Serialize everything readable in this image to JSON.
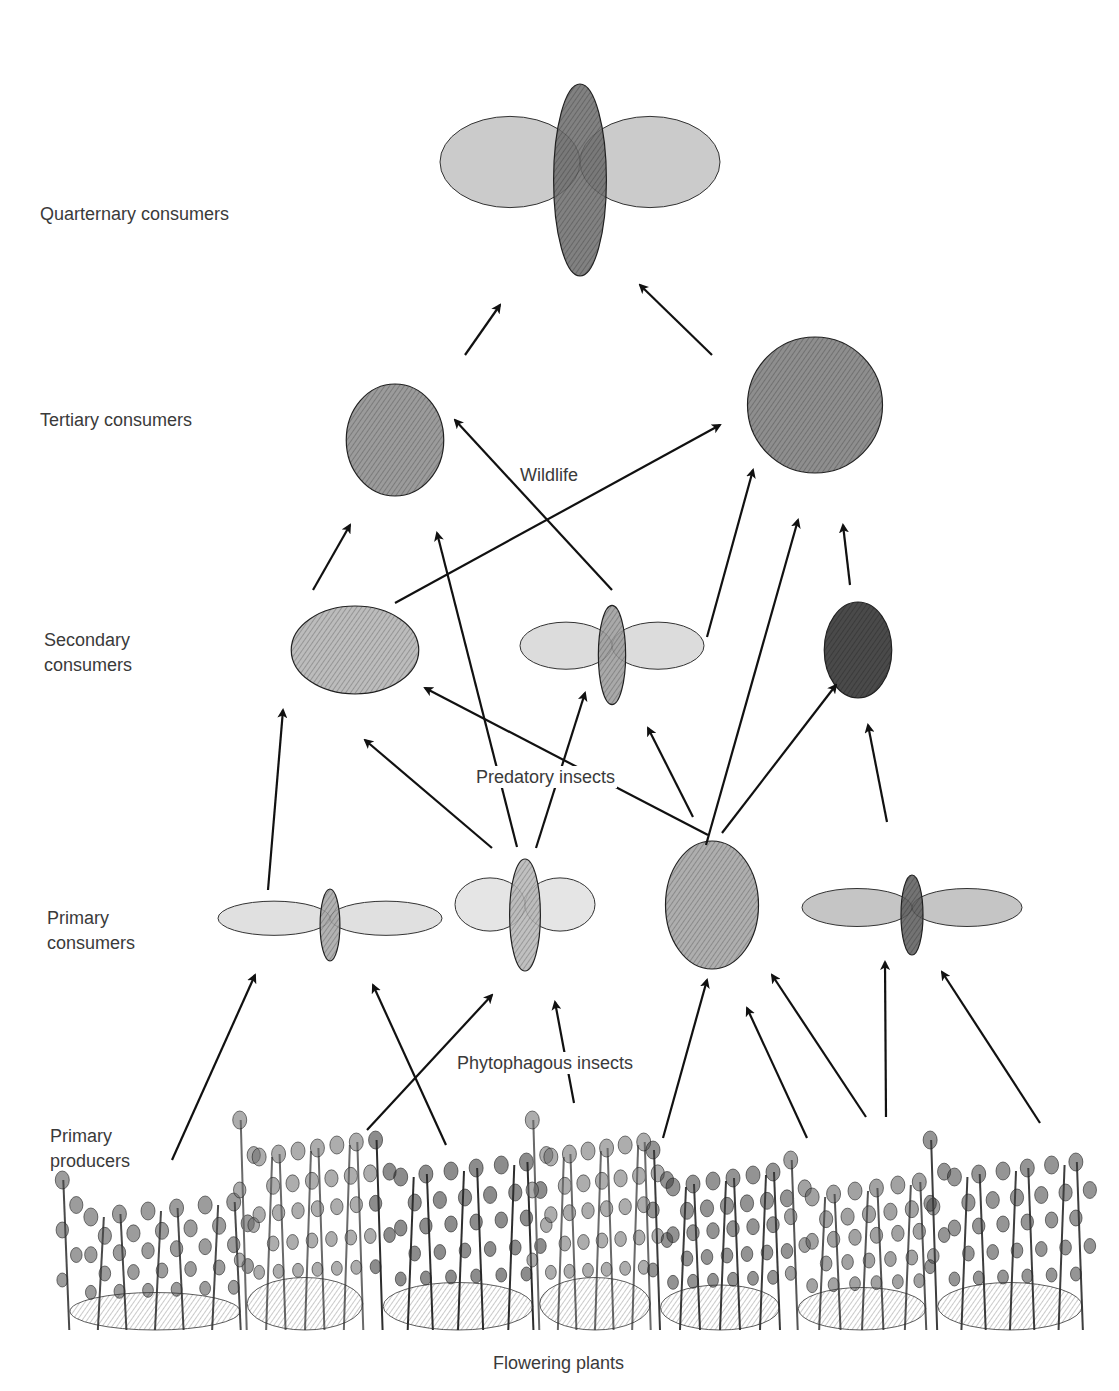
{
  "diagram": {
    "levels": [
      {
        "id": "quaternary",
        "label": "Quarternary consumers",
        "x": 40,
        "y": 202
      },
      {
        "id": "tertiary",
        "label": "Tertiary consumers",
        "x": 40,
        "y": 408
      },
      {
        "id": "secondary",
        "label": "Secondary\nconsumers",
        "x": 44,
        "y": 628
      },
      {
        "id": "primary_consumers",
        "label": "Primary\nconsumers",
        "x": 47,
        "y": 906
      },
      {
        "id": "primary_producers",
        "label": "Primary\nproducers",
        "x": 50,
        "y": 1124
      }
    ],
    "groups": [
      {
        "id": "wildlife",
        "label": "Wildlife",
        "x": 518,
        "y": 464
      },
      {
        "id": "predatory_insects",
        "label": "Predatory insects",
        "x": 474,
        "y": 766
      },
      {
        "id": "phytophagous_insects",
        "label": "Phytophagous insects",
        "x": 455,
        "y": 1052
      },
      {
        "id": "flowering_plants",
        "label": "Flowering plants",
        "x": 491,
        "y": 1352
      }
    ],
    "nodes": [
      {
        "id": "hawk",
        "name": "Hawk",
        "level": "quaternary",
        "cx": 580,
        "cy": 180,
        "rx": 140,
        "ry": 120,
        "shade": "#6b6b6b"
      },
      {
        "id": "frog",
        "name": "Frog",
        "level": "tertiary",
        "cx": 395,
        "cy": 440,
        "rx": 65,
        "ry": 70,
        "shade": "#8a8a8a"
      },
      {
        "id": "partridge",
        "name": "Partridge",
        "level": "tertiary",
        "cx": 815,
        "cy": 405,
        "rx": 90,
        "ry": 85,
        "shade": "#7a7a7a"
      },
      {
        "id": "mantis",
        "name": "Praying mantis",
        "level": "secondary",
        "cx": 355,
        "cy": 650,
        "rx": 85,
        "ry": 55,
        "shade": "#b0b0b0"
      },
      {
        "id": "dragonfly",
        "name": "Dragonfly",
        "level": "secondary",
        "cx": 612,
        "cy": 655,
        "rx": 92,
        "ry": 62,
        "shade": "#9a9a9a"
      },
      {
        "id": "beetle",
        "name": "Ground beetle",
        "level": "secondary",
        "cx": 858,
        "cy": 650,
        "rx": 45,
        "ry": 60,
        "shade": "#2a2a2a"
      },
      {
        "id": "cicada",
        "name": "Cicada",
        "level": "primary_consumers",
        "cx": 330,
        "cy": 925,
        "rx": 112,
        "ry": 45,
        "shade": "#a5a5a5"
      },
      {
        "id": "mosquito",
        "name": "Crane fly",
        "level": "primary_consumers",
        "cx": 525,
        "cy": 915,
        "rx": 70,
        "ry": 70,
        "shade": "#b5b5b5"
      },
      {
        "id": "bug",
        "name": "Plant bug",
        "level": "primary_consumers",
        "cx": 712,
        "cy": 905,
        "rx": 62,
        "ry": 80,
        "shade": "#a0a0a0"
      },
      {
        "id": "moth",
        "name": "Moth",
        "level": "primary_consumers",
        "cx": 912,
        "cy": 915,
        "rx": 110,
        "ry": 50,
        "shade": "#5a5a5a"
      },
      {
        "id": "plant1",
        "name": "Plant 1",
        "level": "primary_producers",
        "cx": 155,
        "cy": 1255,
        "rx": 100,
        "ry": 75,
        "shade": "#4a4a4a"
      },
      {
        "id": "plant2",
        "name": "Plant 2",
        "level": "primary_producers",
        "cx": 305,
        "cy": 1225,
        "rx": 68,
        "ry": 105,
        "shade": "#6a6a6a"
      },
      {
        "id": "plant3",
        "name": "Plant 3",
        "level": "primary_producers",
        "cx": 458,
        "cy": 1235,
        "rx": 88,
        "ry": 95,
        "shade": "#2e2e2e"
      },
      {
        "id": "plant4",
        "name": "Plant 4",
        "level": "primary_producers",
        "cx": 595,
        "cy": 1225,
        "rx": 65,
        "ry": 105,
        "shade": "#6a6a6a"
      },
      {
        "id": "plant5",
        "name": "Plant 5",
        "level": "primary_producers",
        "cx": 720,
        "cy": 1240,
        "rx": 70,
        "ry": 90,
        "shade": "#3a3a3a"
      },
      {
        "id": "plant6",
        "name": "Plant 6",
        "level": "primary_producers",
        "cx": 862,
        "cy": 1245,
        "rx": 75,
        "ry": 85,
        "shade": "#555555"
      },
      {
        "id": "plant7",
        "name": "Plant 7",
        "level": "primary_producers",
        "cx": 1010,
        "cy": 1235,
        "rx": 85,
        "ry": 95,
        "shade": "#3e3e3e"
      }
    ],
    "arrows": [
      {
        "from": "frog",
        "to": "hawk",
        "x1": 465,
        "y1": 355,
        "x2": 500,
        "y2": 305
      },
      {
        "from": "partridge",
        "to": "hawk",
        "x1": 712,
        "y1": 355,
        "x2": 640,
        "y2": 285
      },
      {
        "from": "dragonfly",
        "to": "frog",
        "x1": 612,
        "y1": 590,
        "x2": 455,
        "y2": 420
      },
      {
        "from": "mantis",
        "to": "partridge",
        "x1": 395,
        "y1": 603,
        "x2": 720,
        "y2": 425
      },
      {
        "from": "mantis",
        "to": "frog",
        "x1": 313,
        "y1": 590,
        "x2": 350,
        "y2": 525
      },
      {
        "from": "mosquito",
        "to": "frog",
        "x1": 517,
        "y1": 847,
        "x2": 437,
        "y2": 533
      },
      {
        "from": "dragonfly",
        "to": "partridge",
        "x1": 590,
        "y1": 638,
        "x2": 595,
        "y2": 638
      },
      {
        "from": "dragonfly",
        "to": "partridge",
        "x1": 707,
        "y1": 637,
        "x2": 753,
        "y2": 470
      },
      {
        "from": "bug",
        "to": "partridge",
        "x1": 706,
        "y1": 845,
        "x2": 798,
        "y2": 520
      },
      {
        "from": "beetle",
        "to": "partridge",
        "x1": 850,
        "y1": 585,
        "x2": 843,
        "y2": 525
      },
      {
        "from": "cicada",
        "to": "mantis",
        "x1": 268,
        "y1": 890,
        "x2": 283,
        "y2": 710
      },
      {
        "from": "mosquito",
        "to": "mantis",
        "x1": 492,
        "y1": 848,
        "x2": 365,
        "y2": 740
      },
      {
        "from": "bug",
        "to": "mantis",
        "x1": 708,
        "y1": 835,
        "x2": 425,
        "y2": 688
      },
      {
        "from": "mosquito",
        "to": "dragonfly",
        "x1": 536,
        "y1": 848,
        "x2": 585,
        "y2": 693
      },
      {
        "from": "bug",
        "to": "dragonfly",
        "x1": 693,
        "y1": 817,
        "x2": 648,
        "y2": 728
      },
      {
        "from": "bug",
        "to": "beetle",
        "x1": 722,
        "y1": 833,
        "x2": 836,
        "y2": 685
      },
      {
        "from": "moth",
        "to": "beetle",
        "x1": 887,
        "y1": 822,
        "x2": 868,
        "y2": 725
      },
      {
        "from": "plant1",
        "to": "cicada",
        "x1": 172,
        "y1": 1160,
        "x2": 255,
        "y2": 975
      },
      {
        "from": "plant3",
        "to": "cicada",
        "x1": 446,
        "y1": 1145,
        "x2": 373,
        "y2": 985
      },
      {
        "from": "plant2",
        "to": "mosquito",
        "x1": 367,
        "y1": 1130,
        "x2": 492,
        "y2": 995
      },
      {
        "from": "plant4",
        "to": "mosquito",
        "x1": 574,
        "y1": 1103,
        "x2": 555,
        "y2": 1002
      },
      {
        "from": "plant5",
        "to": "bug",
        "x1": 663,
        "y1": 1138,
        "x2": 707,
        "y2": 980
      },
      {
        "from": "plant6",
        "to": "bug",
        "x1": 807,
        "y1": 1138,
        "x2": 747,
        "y2": 1008
      },
      {
        "from": "plant6",
        "to": "bug",
        "x1": 866,
        "y1": 1117,
        "x2": 772,
        "y2": 975
      },
      {
        "from": "plant6",
        "to": "moth",
        "x1": 886,
        "y1": 1117,
        "x2": 885,
        "y2": 962
      },
      {
        "from": "plant7",
        "to": "moth",
        "x1": 1040,
        "y1": 1123,
        "x2": 942,
        "y2": 972
      }
    ]
  }
}
